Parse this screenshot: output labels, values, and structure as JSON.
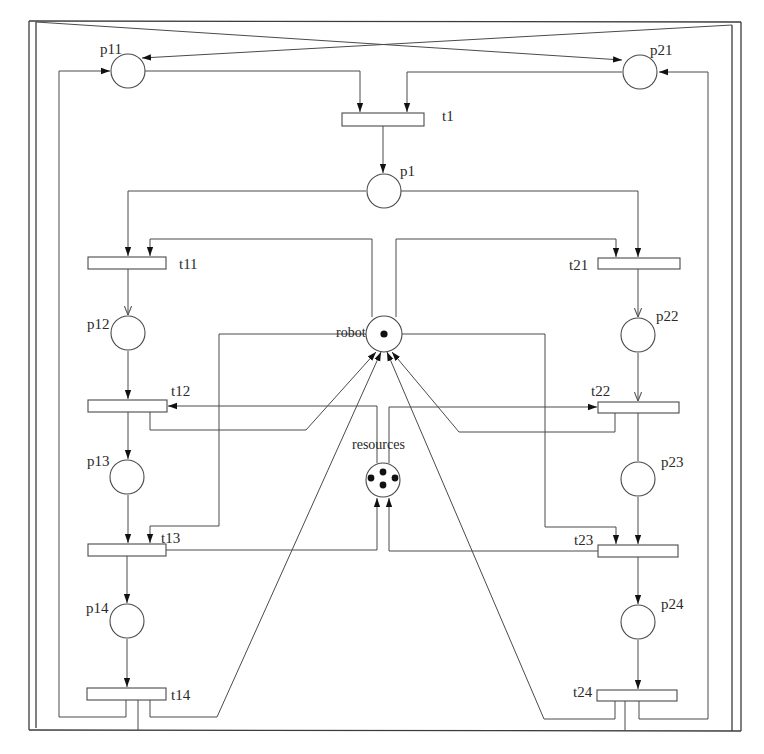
{
  "diagram": {
    "type": "petri-net",
    "places": {
      "p11": {
        "label": "p11",
        "tokens": 0
      },
      "p21": {
        "label": "p21",
        "tokens": 0
      },
      "p1": {
        "label": "p1",
        "tokens": 0
      },
      "p12": {
        "label": "p12",
        "tokens": 0
      },
      "p22": {
        "label": "p22",
        "tokens": 0
      },
      "p13": {
        "label": "p13",
        "tokens": 0
      },
      "p23": {
        "label": "p23",
        "tokens": 0
      },
      "p14": {
        "label": "p14",
        "tokens": 0
      },
      "p24": {
        "label": "p24",
        "tokens": 0
      },
      "robot": {
        "label": "robot",
        "tokens": 1
      },
      "resources": {
        "label": "resources",
        "tokens": 4
      }
    },
    "transitions": {
      "t1": {
        "label": "t1"
      },
      "t11": {
        "label": "t11"
      },
      "t12": {
        "label": "t12"
      },
      "t13": {
        "label": "t13"
      },
      "t14": {
        "label": "t14"
      },
      "t21": {
        "label": "t21"
      },
      "t22": {
        "label": "t22"
      },
      "t23": {
        "label": "t23"
      },
      "t24": {
        "label": "t24"
      }
    },
    "arcs": [
      [
        "p11",
        "t1"
      ],
      [
        "p21",
        "t1"
      ],
      [
        "t1",
        "p1"
      ],
      [
        "p1",
        "t11"
      ],
      [
        "p1",
        "t21"
      ],
      [
        "robot",
        "t11"
      ],
      [
        "robot",
        "t21"
      ],
      [
        "t11",
        "p12"
      ],
      [
        "t21",
        "p22"
      ],
      [
        "p12",
        "t12"
      ],
      [
        "p22",
        "t22"
      ],
      [
        "resources",
        "t12"
      ],
      [
        "resources",
        "t22"
      ],
      [
        "t12",
        "robot"
      ],
      [
        "t22",
        "robot"
      ],
      [
        "t12",
        "p13"
      ],
      [
        "t22",
        "p23"
      ],
      [
        "robot",
        "t13"
      ],
      [
        "robot",
        "t23"
      ],
      [
        "p13",
        "t13"
      ],
      [
        "p23",
        "t23"
      ],
      [
        "t13",
        "resources"
      ],
      [
        "t23",
        "resources"
      ],
      [
        "t13",
        "p14"
      ],
      [
        "t23",
        "p24"
      ],
      [
        "p14",
        "t14"
      ],
      [
        "p24",
        "t24"
      ],
      [
        "t14",
        "robot"
      ],
      [
        "t24",
        "robot"
      ],
      [
        "t14",
        "p11"
      ],
      [
        "t24",
        "p21"
      ],
      [
        "t14",
        "p21"
      ],
      [
        "t24",
        "p11"
      ]
    ]
  }
}
